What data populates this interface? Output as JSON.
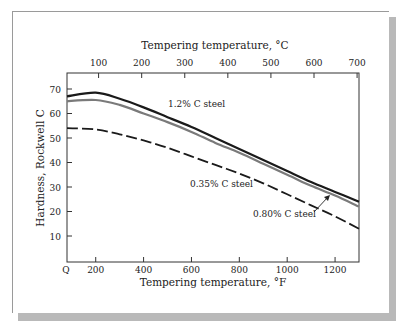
{
  "chart_data": {
    "type": "line",
    "title": "",
    "xlabel": "Tempering temperature, °F",
    "x2label": "Tempering temperature, °C",
    "ylabel": "Hardness, Rockwell C",
    "x_ticks": [
      "Q",
      "200",
      "400",
      "600",
      "800",
      "1000",
      "1200"
    ],
    "x2_ticks": [
      "100",
      "200",
      "300",
      "400",
      "500",
      "600",
      "700"
    ],
    "y_ticks": [
      "10",
      "20",
      "30",
      "40",
      "50",
      "60",
      "70"
    ],
    "xlim": [
      80,
      1300
    ],
    "ylim": [
      0,
      78
    ],
    "grid": false,
    "x": [
      80,
      200,
      300,
      400,
      500,
      600,
      700,
      800,
      900,
      1000,
      1100,
      1200,
      1300
    ],
    "series": [
      {
        "name": "1.2% C steel",
        "style": "solid-black",
        "values": [
          67,
          68.5,
          66,
          62.5,
          58.5,
          54.5,
          50,
          45.5,
          41,
          36.5,
          32,
          28,
          24
        ]
      },
      {
        "name": "0.80% C steel",
        "style": "solid-gray",
        "values": [
          65,
          65.5,
          63.5,
          60,
          56.5,
          52.5,
          48,
          44,
          39.5,
          35,
          30.5,
          26.5,
          22
        ]
      },
      {
        "name": "0.35% C steel",
        "style": "dashed",
        "values": [
          54,
          53.5,
          51.5,
          49,
          46,
          42.5,
          39,
          35.5,
          31.5,
          27,
          22.5,
          18,
          13
        ]
      }
    ],
    "annotations": [
      "1.2% C steel",
      "0.35% C steel",
      "0.80% C steel"
    ]
  }
}
